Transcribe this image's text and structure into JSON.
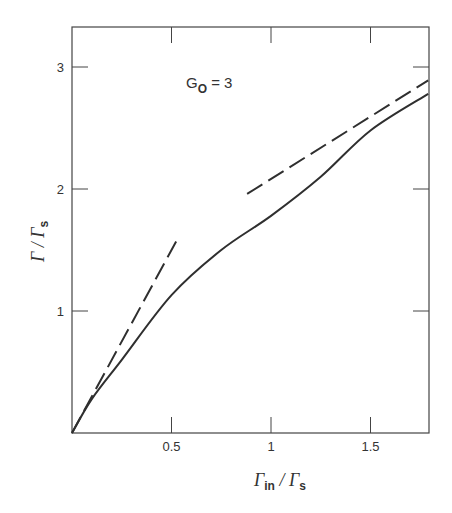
{
  "chart_data": {
    "type": "line",
    "title": "",
    "annotation": "G0 = 3",
    "annotation_main": "G",
    "annotation_sub": "O",
    "annotation_rest": " = 3",
    "xlabel": "Γin / Γs",
    "xlabel_main": "Γ",
    "xlabel_sub": "in",
    "xlabel_sep": " / Γ",
    "xlabel_sub2": "s",
    "ylabel": "Γ / Γs",
    "ylabel_main": "Γ / Γ",
    "ylabel_sub": "s",
    "xlim": [
      0,
      1.79
    ],
    "ylim": [
      0,
      3.3
    ],
    "x_ticks": [
      0.5,
      1,
      1.5
    ],
    "x_tick_labels": [
      "0.5",
      "1",
      "1.5"
    ],
    "y_ticks": [
      1,
      2,
      3
    ],
    "y_tick_labels": [
      "1",
      "2",
      "3"
    ],
    "grid": false,
    "legend": null,
    "series": [
      {
        "name": "exact",
        "style": "solid",
        "x": [
          0,
          0.1,
          0.25,
          0.5,
          0.75,
          1.0,
          1.25,
          1.5,
          1.79
        ],
        "y": [
          0,
          0.28,
          0.6,
          1.13,
          1.5,
          1.78,
          2.1,
          2.48,
          2.78
        ]
      },
      {
        "name": "small-signal asymptote (slope G0)",
        "style": "dashed",
        "x": [
          0,
          0.54
        ],
        "y": [
          0,
          1.62
        ]
      },
      {
        "name": "large-signal asymptote",
        "style": "dashed",
        "x": [
          0.88,
          1.79
        ],
        "y": [
          1.96,
          2.89
        ]
      }
    ]
  },
  "colors": {
    "line": "#2f2f2f",
    "frame": "#444444",
    "background": "#ffffff"
  }
}
